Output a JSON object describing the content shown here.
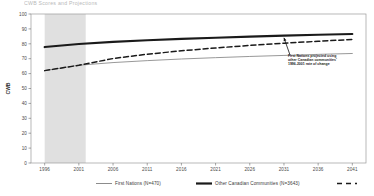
{
  "chart_data": {
    "type": "line",
    "title": "CWB Scores and Projections",
    "xlabel": "",
    "ylabel": "CWB",
    "ylim": [
      0,
      100
    ],
    "xlim": [
      1994,
      2043
    ],
    "yticks": [
      0,
      10,
      20,
      30,
      40,
      50,
      60,
      70,
      80,
      90,
      100
    ],
    "xticks": [
      1996,
      2001,
      2006,
      2011,
      2016,
      2021,
      2026,
      2031,
      2036,
      2041
    ],
    "grid": false,
    "legend_position": "bottom",
    "shaded_region": {
      "label": "observed period",
      "x_start": 1996,
      "x_end": 2002,
      "color": "#e0e0e0"
    },
    "annotation": {
      "text": "First Nations projected using other Canadian communities' 1996-2001 rate of change",
      "x": 2031,
      "y": 84
    },
    "series": [
      {
        "name": "First Nations (N=470)",
        "style": "solid-thin",
        "color": "#8c8c8c",
        "x": [
          1996,
          2001,
          2006,
          2011,
          2016,
          2021,
          2026,
          2031,
          2036,
          2041
        ],
        "values": [
          62.0,
          65.6,
          67.4,
          68.7,
          69.8,
          70.7,
          71.5,
          72.2,
          72.9,
          73.5
        ]
      },
      {
        "name": "Other Canadian Communities (N=3643)",
        "style": "solid-thick",
        "color": "#1a1a1a",
        "x": [
          1996,
          2001,
          2006,
          2011,
          2016,
          2021,
          2026,
          2031,
          2036,
          2041
        ],
        "values": [
          77.8,
          79.9,
          81.3,
          82.4,
          83.3,
          84.1,
          84.8,
          85.5,
          86.1,
          86.6
        ]
      },
      {
        "name": "First Nations projection",
        "style": "dashed",
        "color": "#1a1a1a",
        "x": [
          1996,
          2001,
          2006,
          2011,
          2016,
          2021,
          2026,
          2031,
          2036,
          2041
        ],
        "values": [
          62.0,
          65.6,
          70.1,
          73.0,
          75.3,
          77.2,
          78.9,
          80.4,
          81.7,
          82.9
        ]
      }
    ]
  },
  "legend": {
    "first_nations": "First Nations (N=470)",
    "other_canadian": "Other Canadian Communities (N=3643)",
    "projection": ""
  },
  "axis": {
    "y_title": "CWB"
  }
}
